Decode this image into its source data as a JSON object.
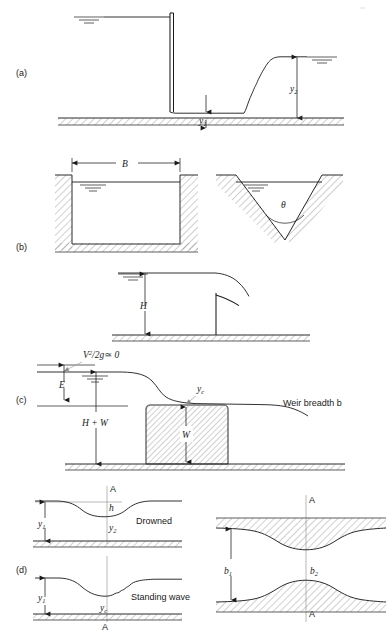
{
  "figure": {
    "panels": [
      "(a)",
      "(b)",
      "(c)",
      "(d)"
    ]
  },
  "panel_a": {
    "label": "(a)",
    "description": "Hydraulic jump downstream of a vertical sluice gate",
    "depth_upstream": "y",
    "depth_upstream_sub": "1",
    "depth_downstream": "y",
    "depth_downstream_sub": "2"
  },
  "panel_b": {
    "label": "(b)",
    "description": "Rectangular notch and V-notch weir cross-sections",
    "breadth": "B",
    "notch_angle": "θ"
  },
  "panel_mid": {
    "description": "Sharp-crested weir with head H",
    "head": "H"
  },
  "panel_c": {
    "label": "(c)",
    "description": "Broad-crested weir with critical depth on crest",
    "velocity_head": "V",
    "velocity_head_sup": "2",
    "velocity_head_mid": "/2g",
    "velocity_head_approx": "≃ 0",
    "energy_head": "E",
    "total_head": "H + W",
    "critical_depth": "y",
    "critical_depth_sub": "c",
    "weir_height": "W",
    "breadth_note": "Weir breadth b"
  },
  "panel_d": {
    "label": "(d)",
    "description": "Venturi flume: drowned flow, standing wave, and plan view",
    "section_line": "A",
    "drowned_caption": "Drowned",
    "standing_wave_caption": "Standing wave",
    "upstream_depth": "y",
    "upstream_depth_sub": "1",
    "throat_depth": "y",
    "throat_depth_sub": "2",
    "head_drop": "h",
    "critical_depth": "y",
    "critical_depth_sub": "c",
    "width_upstream": "b",
    "width_upstream_sub": "1",
    "width_throat": "b",
    "width_throat_sub": "2"
  },
  "colors": {
    "ink": "#1a1a1a",
    "hatch": "#555555",
    "axis": "#8a8a8a",
    "page": "#ffffff"
  }
}
